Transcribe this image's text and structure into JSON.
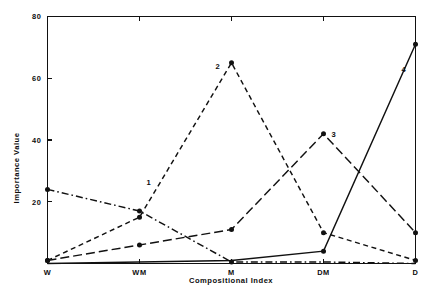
{
  "chart_data": {
    "type": "line",
    "title": "",
    "xlabel": "Compositional Index",
    "ylabel": "Importance Value",
    "categories": [
      "W",
      "WM",
      "M",
      "DM",
      "D"
    ],
    "xtick_labels": [
      "W",
      "WM",
      "M",
      "DM",
      "D"
    ],
    "ytick_labels": [
      "20",
      "40",
      "60",
      "80"
    ],
    "yticks": [
      20,
      40,
      60,
      80
    ],
    "ylim": [
      0,
      80
    ],
    "xlim": [
      0,
      4
    ],
    "grid": false,
    "legend": "inline-labels",
    "background": "#ffffff",
    "line_color": "#111111",
    "series": [
      {
        "name": "1",
        "label": "1",
        "dash": "dash-dot",
        "dasharray": "7,3,1.6,3",
        "values": [
          24,
          17,
          0.5,
          0.5,
          0
        ],
        "points": 3,
        "label_x": 1,
        "label_y": 25.5
      },
      {
        "name": "2",
        "label": "2",
        "dash": "short-dash",
        "dasharray": "5,3.6",
        "values": [
          1,
          15,
          65,
          10,
          1
        ],
        "points": 5,
        "label_x": 2,
        "label_y": 63
      },
      {
        "name": "3",
        "label": "3",
        "dash": "long-dash",
        "dasharray": "9,4",
        "values": [
          1,
          6,
          11,
          42,
          10
        ],
        "points": 5,
        "label_x": 3,
        "label_y": 41
      },
      {
        "name": "4",
        "label": "4",
        "dash": "solid",
        "dasharray": "none",
        "values": [
          0,
          0.5,
          1,
          4,
          71
        ],
        "points": 2,
        "label_x": 4,
        "label_y": 62
      }
    ]
  }
}
